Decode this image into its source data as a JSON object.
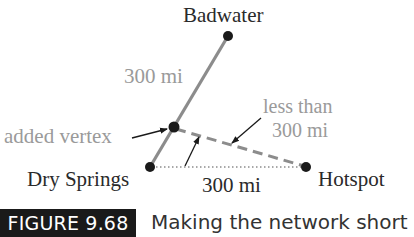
{
  "figure": {
    "label": "FIGURE 9.68",
    "caption": "Making the network short"
  },
  "nodes": [
    {
      "name": "Badwater",
      "x": 228,
      "y": 36
    },
    {
      "name": "added vertex",
      "x": 174,
      "y": 127
    },
    {
      "name": "Dry Springs",
      "x": 150,
      "y": 167
    },
    {
      "name": "Hotspot",
      "x": 306,
      "y": 167
    }
  ],
  "labels": {
    "badwater": "Badwater",
    "dry_springs": "Dry Springs",
    "hotspot": "Hotspot",
    "added_vertex": "added vertex",
    "edge_badwater_dry": "300 mi",
    "edge_dry_hotspot": "300 mi",
    "less_than_line1": "less than",
    "less_than_line2": "300 mi"
  },
  "edges": [
    {
      "from": "Dry Springs",
      "to": "Badwater",
      "label": "300 mi",
      "style": "solid"
    },
    {
      "from": "Dry Springs",
      "to": "Hotspot",
      "label": "300 mi",
      "style": "dotted"
    },
    {
      "from": "added vertex",
      "to": "Hotspot",
      "label": "less than 300 mi",
      "style": "dashed"
    }
  ],
  "colors": {
    "edge_solid": "#8c8c8c",
    "edge_dashed": "#8c8c8c",
    "edge_dotted": "#8c8c8c",
    "node": "#1a1a1a",
    "text_dark": "#2a2a2a",
    "text_gray": "#9a9a9a",
    "caption_bg": "#1a1a1a"
  }
}
